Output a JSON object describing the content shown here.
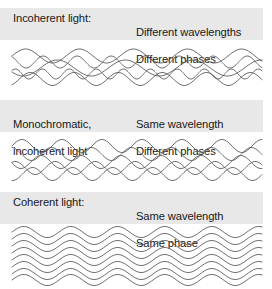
{
  "figure": {
    "background_color": "#ffffff",
    "band_color": "#e8e8e8",
    "wave_color": "#595959",
    "text_color": "#18181a",
    "width": 272,
    "height": 289
  },
  "sections": [
    {
      "id": "incoherent",
      "label_left": "Incoherent light:",
      "label_right_line1": "Different wavelengths",
      "label_right_line2": "Different phases",
      "band_top": 8,
      "band_height": 32,
      "wave_top": 44,
      "wave_height": 44
    },
    {
      "id": "monochromatic-incoherent",
      "label_left_line1": "Monochromatic,",
      "label_left_line2": "incoherent light",
      "label_right_line1": "Same wavelength",
      "label_right_line2": "Different phases",
      "band_top": 100,
      "band_height": 32,
      "wave_top": 136,
      "wave_height": 46
    },
    {
      "id": "coherent",
      "label_left": "Coherent light:",
      "label_right_line1": "Same wavelength",
      "label_right_line2": "Same phase",
      "band_top": 192,
      "band_height": 32,
      "wave_top": 224,
      "wave_height": 62
    }
  ],
  "chart_data": {
    "type": "line",
    "xlabel": "",
    "ylabel": "",
    "panels": [
      {
        "name": "Incoherent light",
        "wavelengths_differ": true,
        "phases_differ": true,
        "waves": [
          {
            "amplitude": 7.0,
            "wavelength": 54,
            "phase_deg": 0,
            "baseline_y": 12
          },
          {
            "amplitude": 6.0,
            "wavelength": 34,
            "phase_deg": 120,
            "baseline_y": 18
          },
          {
            "amplitude": 8.0,
            "wavelength": 68,
            "phase_deg": 210,
            "baseline_y": 24
          },
          {
            "amplitude": 5.0,
            "wavelength": 27,
            "phase_deg": 45,
            "baseline_y": 30
          },
          {
            "amplitude": 6.5,
            "wavelength": 44,
            "phase_deg": 300,
            "baseline_y": 35
          }
        ]
      },
      {
        "name": "Monochromatic, incoherent light",
        "wavelengths_differ": false,
        "phases_differ": true,
        "waves": [
          {
            "amplitude": 6.5,
            "wavelength": 40,
            "phase_deg": 0,
            "baseline_y": 10
          },
          {
            "amplitude": 6.5,
            "wavelength": 40,
            "phase_deg": 95,
            "baseline_y": 18
          },
          {
            "amplitude": 6.5,
            "wavelength": 40,
            "phase_deg": 190,
            "baseline_y": 26
          },
          {
            "amplitude": 6.5,
            "wavelength": 40,
            "phase_deg": 60,
            "baseline_y": 32
          },
          {
            "amplitude": 6.5,
            "wavelength": 40,
            "phase_deg": 265,
            "baseline_y": 38
          }
        ]
      },
      {
        "name": "Coherent light",
        "wavelengths_differ": false,
        "phases_differ": false,
        "waves": [
          {
            "amplitude": 5.5,
            "wavelength": 47,
            "phase_deg": 0,
            "baseline_y": 8
          },
          {
            "amplitude": 5.5,
            "wavelength": 47,
            "phase_deg": 0,
            "baseline_y": 15
          },
          {
            "amplitude": 5.5,
            "wavelength": 47,
            "phase_deg": 0,
            "baseline_y": 22
          },
          {
            "amplitude": 5.5,
            "wavelength": 47,
            "phase_deg": 0,
            "baseline_y": 29
          },
          {
            "amplitude": 5.5,
            "wavelength": 47,
            "phase_deg": 0,
            "baseline_y": 36
          },
          {
            "amplitude": 5.5,
            "wavelength": 47,
            "phase_deg": 0,
            "baseline_y": 43
          },
          {
            "amplitude": 5.5,
            "wavelength": 47,
            "phase_deg": 0,
            "baseline_y": 50
          },
          {
            "amplitude": 5.5,
            "wavelength": 47,
            "phase_deg": 0,
            "baseline_y": 56
          }
        ]
      }
    ]
  }
}
